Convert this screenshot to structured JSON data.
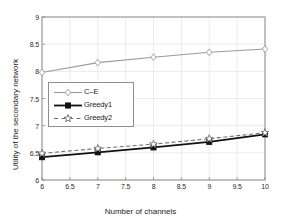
{
  "chart_data": {
    "type": "line",
    "title": "",
    "xlabel": "Number of channels",
    "ylabel": "Utility of the secondary network",
    "xlim": [
      6,
      10
    ],
    "ylim": [
      6,
      9
    ],
    "grid": true,
    "legend_position": "center-left",
    "x": [
      6,
      7,
      8,
      9,
      10
    ],
    "xticks": [
      "6",
      "6.5",
      "7",
      "7.5",
      "8",
      "8.5",
      "9",
      "9.5",
      "10"
    ],
    "xtick_values": [
      6,
      6.5,
      7,
      7.5,
      8,
      8.5,
      9,
      9.5,
      10
    ],
    "yticks": [
      "6",
      "6.5",
      "7",
      "7.5",
      "8",
      "8.5",
      "9"
    ],
    "ytick_values": [
      6,
      6.5,
      7,
      7.5,
      8,
      8.5,
      9
    ],
    "series": [
      {
        "name": "C–E",
        "values": [
          7.98,
          8.16,
          8.26,
          8.35,
          8.41
        ],
        "color": "#9a9a9a",
        "marker": "diamond",
        "dash": "solid",
        "width": 1.1
      },
      {
        "name": "Greedy1",
        "values": [
          6.42,
          6.51,
          6.6,
          6.7,
          6.84
        ],
        "color": "#111111",
        "marker": "square",
        "dash": "solid",
        "width": 1.8
      },
      {
        "name": "Greedy2",
        "values": [
          6.49,
          6.58,
          6.66,
          6.76,
          6.87
        ],
        "color": "#6f6f6f",
        "marker": "star",
        "dash": "dashed",
        "width": 1.1
      }
    ]
  },
  "axes": {
    "grid_color": "#e2e2e2",
    "frame_color": "#8c8c8c",
    "background": "#ffffff"
  },
  "legend": {
    "items": [
      "C–E",
      "Greedy1",
      "Greedy2"
    ]
  }
}
